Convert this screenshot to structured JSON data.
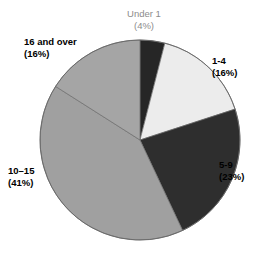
{
  "chart_data": {
    "type": "pie",
    "title": "",
    "subtitle": "",
    "xlabel": "",
    "ylabel": "",
    "legend_position": "none",
    "grid": false,
    "start_angle_deg": 0,
    "direction": "clockwise",
    "categories": [
      "Under 1",
      "1-4",
      "5-9",
      "10–15",
      "16 and over"
    ],
    "values": [
      4,
      16,
      23,
      41,
      16
    ],
    "value_unit": "percent",
    "slices": [
      {
        "label": "Under 1",
        "percent_text": "(4%)",
        "value": 4,
        "color": "#262626",
        "label_color": "#8c8c8c",
        "label_position": "top"
      },
      {
        "label": "1-4",
        "percent_text": "(16%)",
        "value": 16,
        "color": "#ececec",
        "label_color": "#000000",
        "label_position": "right-upper"
      },
      {
        "label": "5-9",
        "percent_text": "(23%)",
        "value": 23,
        "color": "#2e2e2e",
        "label_color": "#000000",
        "label_position": "right-lower"
      },
      {
        "label": "10–15",
        "percent_text": "(41%)",
        "value": 41,
        "color": "#a0a0a0",
        "label_color": "#000000",
        "label_position": "left-lower"
      },
      {
        "label": "16 and over",
        "percent_text": "(16%)",
        "value": 16,
        "color": "#a5a5a5",
        "label_color": "#000000",
        "label_position": "left-upper"
      }
    ]
  },
  "colors": {
    "background": "#ffffff",
    "outline": "#555555",
    "muted_text": "#8c8c8c",
    "text": "#000000"
  },
  "geometry": {
    "center_x": 140,
    "center_y": 140,
    "radius": 100
  }
}
